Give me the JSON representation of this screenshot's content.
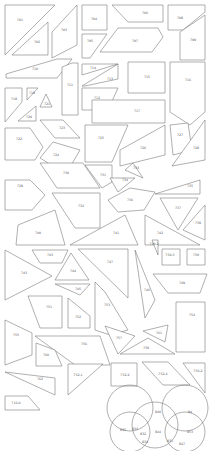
{
  "diagram": {
    "stroke_color": "#7a7a7a",
    "background": "#ffffff",
    "pieces": [
      {
        "id": "p701",
        "label": "701",
        "points": "5,5 55,5 5,55",
        "lx": 20,
        "ly": 20
      },
      {
        "id": "p702",
        "label": "702",
        "points": "12,55 48,22 48,55",
        "lx": 37,
        "ly": 42
      },
      {
        "id": "p703",
        "label": "703",
        "points": "52,32 77,5 77,45 52,58",
        "lx": 64,
        "ly": 30
      },
      {
        "id": "p704",
        "label": "704",
        "points": "82,5 107,5 107,30 82,30",
        "lx": 94,
        "ly": 19
      },
      {
        "id": "p705",
        "label": "705",
        "points": "82,34 107,34 90,58 82,58",
        "lx": 90,
        "ly": 41
      },
      {
        "id": "p706",
        "label": "706",
        "points": "112,5 163,5 163,22 128,22",
        "lx": 145,
        "ly": 13
      },
      {
        "id": "p707",
        "label": "707",
        "points": "118,28 158,28 163,37 152,52 100,52",
        "lx": 135,
        "ly": 41
      },
      {
        "id": "p708",
        "label": "708",
        "points": "168,5 205,5 205,12 183,30 168,30",
        "lx": 180,
        "ly": 18
      },
      {
        "id": "p709",
        "label": "709",
        "points": "205,15 205,60 180,60 180,32",
        "lx": 193,
        "ly": 40
      },
      {
        "id": "p710",
        "label": "710",
        "points": "6,74 57,59 72,59 57,78 6,78",
        "lx": 35,
        "ly": 69
      },
      {
        "id": "p711",
        "label": "711",
        "points": "62,67 72,63 78,63 78,115 62,115",
        "lx": 70,
        "ly": 85
      },
      {
        "id": "p712",
        "label": "712",
        "points": "82,88 118,88 108,110 82,110",
        "lx": 97,
        "ly": 98
      },
      {
        "id": "p713",
        "label": "713",
        "points": "82,86 118,64 118,79 85,86",
        "lx": 110,
        "ly": 79
      },
      {
        "id": "p714",
        "label": "714",
        "points": "82,64 118,64 82,75",
        "lx": 93,
        "ly": 68
      },
      {
        "id": "p715",
        "label": "715",
        "points": "128,62 165,62 165,93 128,93",
        "lx": 147,
        "ly": 77
      },
      {
        "id": "p716",
        "label": "716",
        "points": "170,62 205,62 205,112 190,125 170,112",
        "lx": 188,
        "ly": 80
      },
      {
        "id": "p717",
        "label": "717",
        "points": "92,100 165,100 165,123 92,123",
        "lx": 137,
        "ly": 111
      },
      {
        "id": "p718",
        "label": "718",
        "points": "5,88 22,88 22,102 5,122",
        "lx": 14,
        "ly": 99
      },
      {
        "id": "p719",
        "label": "719",
        "points": "27,88 38,88 27,100",
        "lx": 32,
        "ly": 93
      },
      {
        "id": "p720",
        "label": "720",
        "points": "18,121 36,106 36,121",
        "lx": 29,
        "ly": 117
      },
      {
        "id": "p721",
        "label": "721",
        "points": "40,107 46,94 52,107",
        "lx": 47,
        "ly": 104
      },
      {
        "id": "p722",
        "label": "722",
        "points": "5,128 30,128 43,147 35,160 5,160",
        "lx": 19,
        "ly": 139
      },
      {
        "id": "p723",
        "label": "723",
        "points": "40,120 63,120 80,138 55,138",
        "lx": 62,
        "ly": 128
      },
      {
        "id": "p724",
        "label": "724",
        "points": "40,158 53,142 80,150 66,174",
        "lx": 56,
        "ly": 155
      },
      {
        "id": "p725",
        "label": "725",
        "points": "85,125 128,125 112,162 85,162",
        "lx": 101,
        "ly": 138
      },
      {
        "id": "p726",
        "label": "726",
        "points": "120,150 165,125 165,155 120,166",
        "lx": 143,
        "ly": 148
      },
      {
        "id": "p727",
        "label": "727",
        "points": "170,125 188,123 192,150 173,155",
        "lx": 180,
        "ly": 135
      },
      {
        "id": "p728",
        "label": "728",
        "points": "205,120 205,160 172,166",
        "lx": 196,
        "ly": 148
      },
      {
        "id": "p729",
        "label": "729",
        "points": "5,180 30,180 45,195 32,210 5,210",
        "lx": 20,
        "ly": 186
      },
      {
        "id": "p730",
        "label": "730",
        "points": "40,163 83,163 100,188 57,188",
        "lx": 66,
        "ly": 173
      },
      {
        "id": "p731",
        "label": "731",
        "points": "85,165 112,165 112,182 102,188",
        "lx": 103,
        "ly": 175
      },
      {
        "id": "p732",
        "label": "732",
        "points": "52,193 100,193 100,228 75,228",
        "lx": 81,
        "ly": 206
      },
      {
        "id": "p733",
        "label": "733",
        "points": "125,170 133,163 143,178",
        "lx": 136,
        "ly": 168
      },
      {
        "id": "p734",
        "label": "734",
        "points": "110,178 135,178 118,192",
        "lx": 125,
        "ly": 180
      },
      {
        "id": "p735",
        "label": "735",
        "points": "155,194 200,180 200,194",
        "lx": 190,
        "ly": 186
      },
      {
        "id": "p736",
        "label": "736",
        "points": "108,200 130,188 155,192 144,210 118,212",
        "lx": 130,
        "ly": 200
      },
      {
        "id": "p737",
        "label": "737",
        "points": "160,198 198,198 178,230",
        "lx": 178,
        "ly": 208
      },
      {
        "id": "p738",
        "label": "738",
        "points": "205,205 205,240 183,230",
        "lx": 198,
        "ly": 223
      },
      {
        "id": "p740",
        "label": "740",
        "points": "18,225 55,210 65,245 16,245",
        "lx": 38,
        "ly": 233
      },
      {
        "id": "p741",
        "label": "741",
        "points": "70,245 125,215 138,245",
        "lx": 116,
        "ly": 233
      },
      {
        "id": "p742",
        "label": "742",
        "points": "145,215 200,245 145,245",
        "lx": 160,
        "ly": 233
      },
      {
        "id": "p743",
        "label": "743",
        "points": "5,250 52,276 5,300",
        "lx": 24,
        "ly": 273
      },
      {
        "id": "p743b",
        "label": "743",
        "points": "32,250 68,250 62,263 40,263",
        "lx": 50,
        "ly": 255
      },
      {
        "id": "p744",
        "label": "744",
        "points": "55,280 71,253 89,280",
        "lx": 73,
        "ly": 271
      },
      {
        "id": "p745",
        "label": "745",
        "points": "55,284 90,284 80,295",
        "lx": 78,
        "ly": 289
      },
      {
        "id": "p747",
        "label": "747",
        "points": "78,249 128,249 128,298",
        "lx": 110,
        "ly": 262
      },
      {
        "id": "p749",
        "label": "749",
        "points": "153,274 207,274 200,293 168,293",
        "lx": 182,
        "ly": 283
      },
      {
        "id": "p746",
        "label": "746",
        "points": "135,250 155,300 145,318",
        "lx": 147,
        "ly": 290
      },
      {
        "id": "p751",
        "label": "751",
        "points": "28,296 62,296 62,328 40,328",
        "lx": 49,
        "ly": 307
      },
      {
        "id": "p752",
        "label": "752",
        "points": "68,298 90,316 90,328 68,328",
        "lx": 78,
        "ly": 317
      },
      {
        "id": "p753",
        "label": "753",
        "points": "95,282 105,292 128,330 110,335 95,330",
        "lx": 107,
        "ly": 305
      },
      {
        "id": "p754",
        "label": "754",
        "points": "176,302 205,302 205,352 176,352",
        "lx": 192,
        "ly": 315
      },
      {
        "id": "p755",
        "label": "755",
        "points": "5,320 32,333 32,355 5,365",
        "lx": 16,
        "ly": 335
      },
      {
        "id": "p756",
        "label": "756",
        "points": "35,336 100,336 110,365 75,365",
        "lx": 84,
        "ly": 344
      },
      {
        "id": "p757",
        "label": "757",
        "points": "105,326 135,336 118,354",
        "lx": 119,
        "ly": 338
      },
      {
        "id": "p758",
        "label": "758",
        "points": "120,354 148,338 175,354",
        "lx": 146,
        "ly": 348
      },
      {
        "id": "p760",
        "label": "760",
        "points": "36,343 55,350 62,366 36,366",
        "lx": 46,
        "ly": 355
      },
      {
        "id": "p761",
        "label": "761",
        "points": "143,331 168,325 165,342",
        "lx": 159,
        "ly": 333
      },
      {
        "id": "p762",
        "label": "762",
        "points": "5,372 55,378 55,395",
        "lx": 40,
        "ly": 379
      },
      {
        "id": "p7521",
        "label": "752-1",
        "points": "68,364 103,364 68,395",
        "lx": 78,
        "ly": 375
      },
      {
        "id": "p7522",
        "label": "752-2",
        "points": "111,363 137,363 137,386 111,386",
        "lx": 125,
        "ly": 375
      },
      {
        "id": "p7524",
        "label": "752-4",
        "points": "142,362 168,362 190,385 163,385",
        "lx": 163,
        "ly": 374
      },
      {
        "id": "p7562",
        "label": "756-2",
        "points": "183,363 205,363 205,393",
        "lx": 198,
        "ly": 371
      },
      {
        "id": "p7160",
        "label": "716-0",
        "points": "5,396 28,396 40,410 5,410",
        "lx": 16,
        "ly": 403
      },
      {
        "id": "p7502",
        "label": "750-2",
        "points": "152,240 158,240 158,255",
        "lx": 154,
        "ly": 244
      },
      {
        "id": "p7504",
        "label": "750-3",
        "points": "162,249 180,249 180,265 162,265",
        "lx": 170,
        "ly": 255
      },
      {
        "id": "p7503",
        "label": "750",
        "points": "187,249 205,249 205,265 187,265",
        "lx": 196,
        "ly": 255
      }
    ],
    "circles": [
      {
        "cx": 130,
        "cy": 408,
        "r": 23
      },
      {
        "cx": 185,
        "cy": 408,
        "r": 23
      },
      {
        "cx": 155,
        "cy": 425,
        "r": 23
      },
      {
        "cx": 130,
        "cy": 432,
        "r": 20
      },
      {
        "cx": 185,
        "cy": 432,
        "r": 20
      }
    ],
    "circle_labels": [
      {
        "label": "840",
        "x": 158,
        "y": 412
      },
      {
        "label": "84",
        "x": 190,
        "y": 412
      },
      {
        "label": "835",
        "x": 123,
        "y": 430
      },
      {
        "label": "833",
        "x": 135,
        "y": 429
      },
      {
        "label": "832",
        "x": 143,
        "y": 434
      },
      {
        "label": "834",
        "x": 145,
        "y": 442
      },
      {
        "label": "844",
        "x": 158,
        "y": 432
      },
      {
        "label": "831",
        "x": 170,
        "y": 441
      },
      {
        "label": "853",
        "x": 190,
        "y": 432
      },
      {
        "label": "847",
        "x": 182,
        "y": 444
      }
    ]
  }
}
